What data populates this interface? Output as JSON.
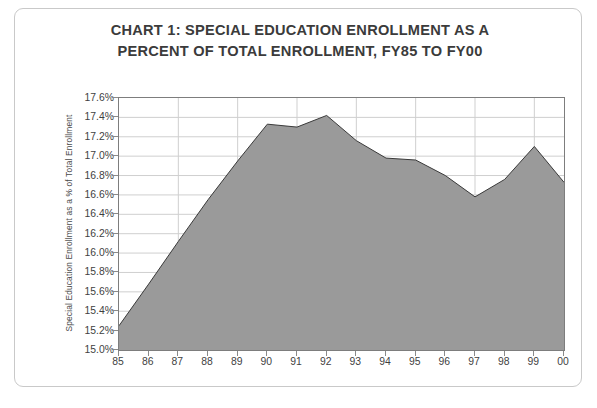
{
  "chart_data": {
    "type": "area",
    "title": "CHART 1: SPECIAL EDUCATION ENROLLMENT AS A PERCENT OF TOTAL ENROLLMENT, FY85 TO FY00",
    "title_lines": [
      "CHART 1: SPECIAL EDUCATION ENROLLMENT AS A",
      "PERCENT OF TOTAL ENROLLMENT, FY85 TO FY00"
    ],
    "xlabel": "",
    "ylabel": "Special Education Enrollment as a % of Total Enrollment",
    "categories": [
      "85",
      "86",
      "87",
      "88",
      "89",
      "90",
      "91",
      "92",
      "93",
      "94",
      "95",
      "96",
      "97",
      "98",
      "99",
      "00"
    ],
    "values": [
      15.25,
      15.68,
      16.12,
      16.55,
      16.95,
      17.33,
      17.3,
      17.42,
      17.16,
      16.98,
      16.96,
      16.8,
      16.58,
      16.76,
      17.1,
      16.73
    ],
    "value_labels": [
      "15.25%",
      "15.68%",
      "16.12%",
      "16.55%",
      "16.95%",
      "17.33%",
      "17.30%",
      "17.42%",
      "17.16%",
      "16.98%",
      "16.96%",
      "16.80%",
      "16.58%",
      "16.76%",
      "17.10%",
      "16.73%"
    ],
    "ylim": [
      15.0,
      17.6
    ],
    "ytick_values": [
      17.6,
      17.4,
      17.2,
      17.0,
      16.8,
      16.6,
      16.4,
      16.2,
      16.0,
      15.8,
      15.6,
      15.4,
      15.2,
      15.0
    ],
    "ytick_labels": [
      "17.6%",
      "17.4%",
      "17.2%",
      "17.0%",
      "16.8%",
      "16.6%",
      "16.4%",
      "16.2%",
      "16.0%",
      "15.8%",
      "15.6%",
      "15.4%",
      "15.2%",
      "15.0%"
    ],
    "grid": true,
    "grid_color": "#cfcfcf",
    "legend": false,
    "legend_position": "none",
    "area_fill_color": "#9a9a9a",
    "line_color": "#3a3a3a",
    "plot_border_color": "#7d7d7d",
    "background_color": "#ffffff",
    "title_color": "#3b3b3b",
    "frame_color": "#c9c9c9",
    "xgrid_categories": [
      "87",
      "89",
      "91",
      "93",
      "95",
      "97",
      "99"
    ]
  }
}
